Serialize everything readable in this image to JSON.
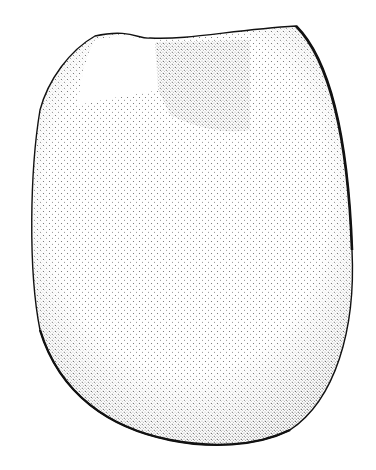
{
  "figure": {
    "background": "#ffffff",
    "ink": "#111111",
    "caption": ""
  }
}
